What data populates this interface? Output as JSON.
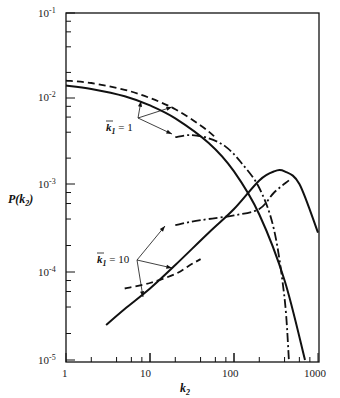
{
  "chart_data": {
    "type": "line",
    "title": "",
    "xlabel": "k2",
    "ylabel": "P(k2)",
    "xscale": "log",
    "yscale": "log",
    "xlim": [
      1,
      1000
    ],
    "ylim": [
      1e-05,
      0.1
    ],
    "x_tick_labels": [
      "1",
      "10",
      "100",
      "1000"
    ],
    "y_tick_labels": [
      {
        "base": "10",
        "exp": "-1"
      },
      {
        "base": "10",
        "exp": "-2"
      },
      {
        "base": "10",
        "exp": "-3"
      },
      {
        "base": "10",
        "exp": "-4"
      },
      {
        "base": "10",
        "exp": "-5"
      }
    ],
    "grid": false,
    "legend": null,
    "annotations": [
      {
        "text_base": "k",
        "text_sub": "1",
        "text_eq": " = 1",
        "bar": true
      },
      {
        "text_base": "k",
        "text_sub": "1",
        "text_eq": " = 10",
        "bar": true
      }
    ],
    "series": [
      {
        "name": "k1=1 solid",
        "style": "solid",
        "x": [
          1,
          2,
          5,
          10,
          20,
          50,
          100,
          200,
          400,
          700
        ],
        "y": [
          0.014,
          0.0128,
          0.0105,
          0.0082,
          0.0058,
          0.003,
          0.0014,
          0.00045,
          8e-05,
          1e-05
        ]
      },
      {
        "name": "k1=1 dashed",
        "style": "dashed",
        "x": [
          1,
          2,
          5,
          10,
          20,
          40,
          60
        ],
        "y": [
          0.016,
          0.015,
          0.0125,
          0.01,
          0.0074,
          0.0048,
          0.0035
        ]
      },
      {
        "name": "k1=1 dash-dot",
        "style": "dashdot",
        "x": [
          20,
          30,
          50,
          80,
          120,
          200,
          300,
          400,
          450
        ],
        "y": [
          0.0035,
          0.0037,
          0.0034,
          0.0027,
          0.0018,
          0.0009,
          0.0003,
          5e-05,
          1e-05
        ]
      },
      {
        "name": "k1=10 solid",
        "style": "solid",
        "x": [
          3,
          5,
          10,
          20,
          50,
          100,
          200,
          300,
          400,
          600,
          1000
        ],
        "y": [
          2.5e-05,
          3.8e-05,
          6.5e-05,
          0.00012,
          0.00028,
          0.00052,
          0.0011,
          0.0014,
          0.0014,
          0.001,
          0.00028
        ]
      },
      {
        "name": "k1=10 dashed",
        "style": "dashed",
        "x": [
          5,
          10,
          20,
          30,
          40
        ],
        "y": [
          6.5e-05,
          7.5e-05,
          9.5e-05,
          0.00012,
          0.00014
        ]
      },
      {
        "name": "k1=10 dash-dot",
        "style": "dashdot",
        "x": [
          20,
          30,
          50,
          100,
          200,
          300,
          450
        ],
        "y": [
          0.00034,
          0.00037,
          0.0004,
          0.00044,
          0.00052,
          0.0008,
          0.0011
        ]
      }
    ],
    "frame": {
      "left": 66,
      "right": 319,
      "top": 13,
      "bottom": 362,
      "x_decade_px": [
        66,
        150,
        234,
        318
      ],
      "y_decade_px": [
        13,
        98,
        184,
        272,
        360
      ]
    },
    "line_color": "#111111"
  }
}
